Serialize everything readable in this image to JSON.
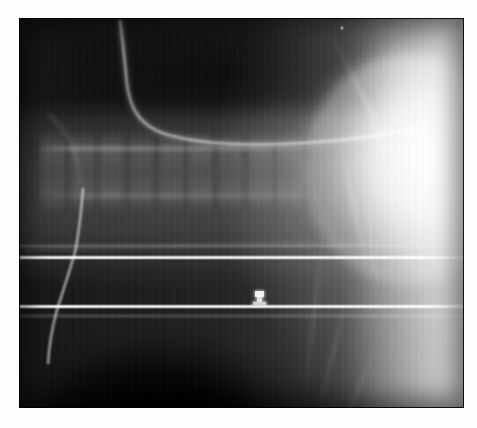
{
  "viewer": {
    "kind": "radiograph-image-viewer",
    "modality": "X-ray (plain radiograph)",
    "view": "lateral cervico-thoracic / upper chest",
    "background_color": "#fdfdfd",
    "width": 477,
    "height": 428
  },
  "plate": {
    "name": "radiograph-plate",
    "left": 19,
    "top": 18,
    "width": 445,
    "height": 390,
    "border_color": "#ffffff",
    "base_color": "#1d1d1d",
    "bright_color": "#f2f2f2",
    "grayscale": true
  },
  "features": {
    "base_field": {
      "label": "exposure-field",
      "description": "dark at upper-left, graded bright toward right"
    },
    "soft_tissue_band": {
      "label": "soft-tissue-band",
      "description": "broad mid horizontal grey band"
    },
    "air_column": {
      "label": "air-column",
      "description": "dark prevertebral / lung air above spine"
    },
    "spine": {
      "label": "vertebral-column",
      "description": "stack of faint vertebral bodies running horizontally",
      "vertebra_count": 9,
      "segment_left_pct": 4,
      "segment_top_pct": 29
    },
    "tube": {
      "label": "radio-opaque-tube",
      "description": "thin bright catheter curving from upper-left then running horizontally"
    },
    "vessel": {
      "label": "vascular-line",
      "description": "bright curved line descending in the lower-left"
    },
    "shoulder": {
      "label": "shoulder-humeral-head",
      "description": "bright rounded dense structure at upper-right"
    },
    "right_slab": {
      "label": "right-soft-tissue-slab",
      "description": "bright band along right margin"
    },
    "dome": {
      "label": "diaphragm-dome",
      "description": "dark dome shape in lower-middle-left"
    },
    "marker": {
      "label": "metallic-marker",
      "description": "small bright radio-opaque marker near image centre",
      "x": 236,
      "y": 273,
      "width": 9,
      "height": 14
    },
    "speck": {
      "label": "bright-speck",
      "x": 322,
      "y": 9,
      "size": 2
    }
  },
  "grid_lines": [
    {
      "name": "collimation-line-upper",
      "y": 237,
      "thickness": 5,
      "intensity": "bright"
    },
    {
      "name": "collimation-line-lower",
      "y": 286,
      "thickness": 5,
      "intensity": "bright"
    },
    {
      "name": "collimation-line-faint-upper",
      "y": 226,
      "thickness": 4,
      "intensity": "faint"
    },
    {
      "name": "collimation-line-faint-lower",
      "y": 296,
      "thickness": 4,
      "intensity": "faint"
    }
  ],
  "vertebrae": [
    {
      "left_pct": 1,
      "width_pct": 9
    },
    {
      "left_pct": 10,
      "width_pct": 9
    },
    {
      "left_pct": 19,
      "width_pct": 9
    },
    {
      "left_pct": 28,
      "width_pct": 9
    },
    {
      "left_pct": 37,
      "width_pct": 9
    },
    {
      "left_pct": 46,
      "width_pct": 9
    },
    {
      "left_pct": 55,
      "width_pct": 9
    },
    {
      "left_pct": 64,
      "width_pct": 9
    },
    {
      "left_pct": 73,
      "width_pct": 9
    }
  ],
  "streaks": [
    {
      "left_pct": 70,
      "top_pct": 4,
      "width_pct": 34,
      "height_px": 3,
      "rotate": 62,
      "opacity": 0.45
    },
    {
      "left_pct": 76,
      "top_pct": 16,
      "width_pct": 28,
      "height_px": 3,
      "rotate": 70,
      "opacity": 0.4
    },
    {
      "left_pct": 72,
      "top_pct": 30,
      "width_pct": 34,
      "height_px": 4,
      "rotate": 78,
      "opacity": 0.38
    },
    {
      "left_pct": 78,
      "top_pct": 44,
      "width_pct": 26,
      "height_px": 3,
      "rotate": 84,
      "opacity": 0.34
    },
    {
      "left_pct": 68,
      "top_pct": 56,
      "width_pct": 36,
      "height_px": 3,
      "rotate": 96,
      "opacity": 0.3
    },
    {
      "left_pct": 74,
      "top_pct": 70,
      "width_pct": 30,
      "height_px": 3,
      "rotate": 104,
      "opacity": 0.28
    },
    {
      "left_pct": 80,
      "top_pct": 84,
      "width_pct": 24,
      "height_px": 3,
      "rotate": 112,
      "opacity": 0.26
    },
    {
      "left_pct": 86,
      "top_pct": 24,
      "width_pct": 20,
      "height_px": 3,
      "rotate": 58,
      "opacity": 0.42
    }
  ]
}
